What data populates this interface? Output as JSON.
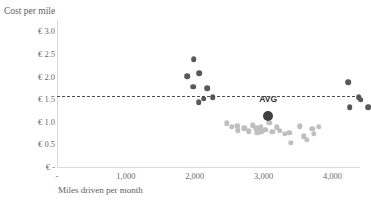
{
  "chart_data": {
    "type": "scatter",
    "title": "",
    "clipped_top_text": "",
    "xlabel": "Miles driven per month",
    "ylabel": "Cost per mile",
    "xlim": [
      0,
      4400
    ],
    "ylim": [
      0,
      3.25
    ],
    "grid": false,
    "legend": null,
    "xticks": [
      {
        "value": 0,
        "label": "-"
      },
      {
        "value": 1000,
        "label": "1,000"
      },
      {
        "value": 2000,
        "label": "2,000"
      },
      {
        "value": 3000,
        "label": "3,000"
      },
      {
        "value": 4000,
        "label": "4,000"
      }
    ],
    "yticks": [
      {
        "value": 3.0,
        "label": "€ 3.0"
      },
      {
        "value": 2.5,
        "label": "€ 2.5"
      },
      {
        "value": 2.0,
        "label": "€ 2.0"
      },
      {
        "value": 1.5,
        "label": "€ 1.5"
      },
      {
        "value": 1.0,
        "label": "€ 1.0"
      },
      {
        "value": 0.5,
        "label": "€ 0.5"
      },
      {
        "value": 0.0,
        "label": "€ -"
      }
    ],
    "average": {
      "label": "AVG",
      "x": 2240,
      "y": 1.56,
      "line_value": 1.56,
      "color": "#404040"
    },
    "series": [
      {
        "name": "above-average",
        "color": "#595959",
        "points": [
          {
            "x": 1160,
            "y": 2.82
          },
          {
            "x": 1060,
            "y": 2.45
          },
          {
            "x": 1235,
            "y": 2.52
          },
          {
            "x": 1150,
            "y": 2.22
          },
          {
            "x": 1355,
            "y": 2.18
          },
          {
            "x": 1300,
            "y": 1.95
          },
          {
            "x": 1230,
            "y": 1.88
          },
          {
            "x": 1435,
            "y": 1.98
          },
          {
            "x": 3405,
            "y": 2.32
          },
          {
            "x": 3555,
            "y": 1.98
          },
          {
            "x": 3580,
            "y": 1.93
          },
          {
            "x": 3420,
            "y": 1.76
          },
          {
            "x": 3690,
            "y": 1.77
          }
        ]
      },
      {
        "name": "below-average",
        "color": "#bfbfbf",
        "points": [
          {
            "x": 1640,
            "y": 1.41
          },
          {
            "x": 1715,
            "y": 1.33
          },
          {
            "x": 1790,
            "y": 1.35
          },
          {
            "x": 1795,
            "y": 1.25
          },
          {
            "x": 1890,
            "y": 1.3
          },
          {
            "x": 1960,
            "y": 1.23
          },
          {
            "x": 2020,
            "y": 1.36
          },
          {
            "x": 2065,
            "y": 1.3
          },
          {
            "x": 2080,
            "y": 1.2
          },
          {
            "x": 2135,
            "y": 1.33
          },
          {
            "x": 2140,
            "y": 1.23
          },
          {
            "x": 2195,
            "y": 1.27
          },
          {
            "x": 2255,
            "y": 1.42
          },
          {
            "x": 2300,
            "y": 1.22
          },
          {
            "x": 2360,
            "y": 1.32
          },
          {
            "x": 2410,
            "y": 1.24
          },
          {
            "x": 2480,
            "y": 1.18
          },
          {
            "x": 2545,
            "y": 1.2
          },
          {
            "x": 2570,
            "y": 0.98
          },
          {
            "x": 2700,
            "y": 1.34
          },
          {
            "x": 2760,
            "y": 1.12
          },
          {
            "x": 2800,
            "y": 1.05
          },
          {
            "x": 2880,
            "y": 1.28
          },
          {
            "x": 2900,
            "y": 1.17
          },
          {
            "x": 2975,
            "y": 1.33
          }
        ]
      }
    ]
  }
}
